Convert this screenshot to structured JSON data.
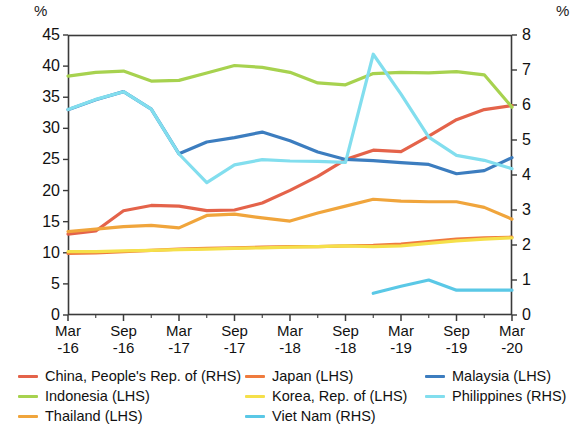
{
  "chart_data": {
    "type": "line",
    "title": "",
    "subtitle": "",
    "xlabel": "",
    "ylabel": "%",
    "y2label": "%",
    "left_axis_unit": "%",
    "right_axis_unit": "%",
    "ylim": [
      0,
      45
    ],
    "y2lim": [
      0,
      8
    ],
    "yticks": [
      0,
      5,
      10,
      15,
      20,
      25,
      30,
      35,
      40,
      45
    ],
    "y2ticks": [
      0,
      1,
      2,
      3,
      4,
      5,
      6,
      7,
      8
    ],
    "grid": false,
    "legend_position": "bottom",
    "x": [
      "Mar-16",
      "Jun-16",
      "Sep-16",
      "Dec-16",
      "Mar-17",
      "Jun-17",
      "Sep-17",
      "Dec-17",
      "Mar-18",
      "Jun-18",
      "Sep-18",
      "Dec-18",
      "Mar-19",
      "Jun-19",
      "Sep-19",
      "Dec-19",
      "Mar-20"
    ],
    "xtick_labels": [
      {
        "top": "Mar",
        "bottom": "-16"
      },
      {
        "top": "Sep",
        "bottom": "-16"
      },
      {
        "top": "Mar",
        "bottom": "-17"
      },
      {
        "top": "Sep",
        "bottom": "-17"
      },
      {
        "top": "Mar",
        "bottom": "-18"
      },
      {
        "top": "Sep",
        "bottom": "-18"
      },
      {
        "top": "Mar",
        "bottom": "-19"
      },
      {
        "top": "Sep",
        "bottom": "-19"
      },
      {
        "top": "Mar",
        "bottom": "-20"
      }
    ],
    "series": [
      {
        "name": "China, People's Rep. of (RHS)",
        "axis": "right",
        "color": "#E4634A",
        "values": [
          2.31,
          2.4,
          2.98,
          3.13,
          3.11,
          2.98,
          3.0,
          3.2,
          3.56,
          3.96,
          4.44,
          4.71,
          4.67,
          5.11,
          5.58,
          5.87,
          5.98
        ]
      },
      {
        "name": "Indonesia (LHS)",
        "axis": "left",
        "color": "#A7D24F",
        "values": [
          38.4,
          39.0,
          39.2,
          37.6,
          37.7,
          38.9,
          40.1,
          39.8,
          39.0,
          37.3,
          37.0,
          38.8,
          39.0,
          38.9,
          39.1,
          38.6,
          33.4
        ]
      },
      {
        "name": "Thailand (LHS)",
        "axis": "left",
        "color": "#F0A53C",
        "values": [
          13.4,
          13.8,
          14.2,
          14.4,
          14.0,
          16.0,
          16.2,
          15.6,
          15.1,
          16.4,
          17.5,
          18.6,
          18.3,
          18.2,
          18.2,
          17.3,
          15.4
        ]
      },
      {
        "name": "Japan (LHS)",
        "axis": "left",
        "color": "#EF7B3E",
        "values": [
          9.9,
          10.0,
          10.2,
          10.4,
          10.6,
          10.7,
          10.8,
          10.9,
          11.0,
          11.0,
          11.1,
          11.2,
          11.4,
          11.8,
          12.2,
          12.4,
          12.5
        ]
      },
      {
        "name": "Korea, Rep. of (LHS)",
        "axis": "left",
        "color": "#F5E04A",
        "values": [
          10.2,
          10.2,
          10.3,
          10.4,
          10.5,
          10.6,
          10.7,
          10.8,
          10.9,
          11.0,
          11.1,
          11.0,
          11.1,
          11.5,
          11.9,
          12.2,
          12.4
        ]
      },
      {
        "name": "Malaysia (LHS)",
        "axis": "left",
        "color": "#3C7DBF",
        "values": [
          33.0,
          34.6,
          35.9,
          33.1,
          25.9,
          27.8,
          28.5,
          29.4,
          28.0,
          26.2,
          25.0,
          24.8,
          24.5,
          24.2,
          22.7,
          23.2,
          25.3
        ]
      },
      {
        "name": "Philippines (RHS)",
        "axis": "right",
        "color": "#82DEEE",
        "values": [
          5.87,
          6.16,
          6.38,
          5.88,
          4.6,
          3.78,
          4.29,
          4.44,
          4.4,
          4.39,
          4.36,
          7.45,
          6.31,
          5.08,
          4.56,
          4.42,
          4.18
        ]
      },
      {
        "name": "Viet Nam (RHS)",
        "axis": "right",
        "color": "#5AC8E6",
        "values": [
          null,
          null,
          null,
          null,
          null,
          null,
          null,
          null,
          null,
          null,
          null,
          0.62,
          0.82,
          1.0,
          0.71,
          0.71,
          0.71
        ]
      }
    ],
    "legend": [
      {
        "label": "China, People's Rep. of (RHS)",
        "color": "#E4634A"
      },
      {
        "label": "Indonesia (LHS)",
        "color": "#A7D24F"
      },
      {
        "label": "Thailand (LHS)",
        "color": "#F0A53C"
      },
      {
        "label": "Japan (LHS)",
        "color": "#EF7B3E"
      },
      {
        "label": "Korea, Rep. of (LHS)",
        "color": "#F5E04A"
      },
      {
        "label": "Viet Nam (RHS)",
        "color": "#5AC8E6"
      },
      {
        "label": "Malaysia (LHS)",
        "color": "#3C7DBF"
      },
      {
        "label": "Philippines (RHS)",
        "color": "#82DEEE"
      }
    ]
  },
  "plot": {
    "left": 68,
    "right": 512,
    "top": 35,
    "bottom": 315,
    "frame_color": "#3a3a3a"
  }
}
